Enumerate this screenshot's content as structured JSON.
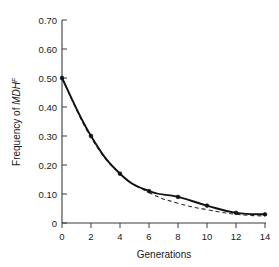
{
  "figure": {
    "background_color": "#ffffff",
    "line_color": "#111111",
    "axis_color": "#3b3b3b"
  },
  "chart_data": {
    "type": "line",
    "title": "",
    "xlabel": "Generations",
    "ylabel_prefix": "Frequency of ",
    "ylabel_gene": "MDH",
    "ylabel_superscript": "F",
    "ylabel_full": "Frequency of MDHᶠ",
    "x": [
      0,
      2,
      4,
      6,
      8,
      10,
      12,
      14
    ],
    "xlim": [
      0,
      14
    ],
    "ylim": [
      0,
      0.7
    ],
    "xticks": [
      0,
      2,
      4,
      6,
      8,
      10,
      12,
      14
    ],
    "xtick_labels": [
      "0",
      "2",
      "4",
      "6",
      "8",
      "10",
      "12",
      "14"
    ],
    "yticks": [
      0,
      0.1,
      0.2,
      0.3,
      0.4,
      0.5,
      0.6,
      0.7
    ],
    "ytick_labels": [
      "0",
      "0.10",
      "0.20",
      "0.30",
      "0.40",
      "0.50",
      "0.60",
      "0.70"
    ],
    "grid": false,
    "legend": null,
    "series": [
      {
        "name": "observed",
        "style": "solid",
        "markers": true,
        "values": [
          0.5,
          0.3,
          0.17,
          0.11,
          0.09,
          0.06,
          0.035,
          0.03
        ]
      },
      {
        "name": "expected",
        "style": "dashed",
        "markers": false,
        "values": [
          0.5,
          0.295,
          0.17,
          0.105,
          0.068,
          0.046,
          0.03,
          0.024
        ]
      }
    ]
  }
}
